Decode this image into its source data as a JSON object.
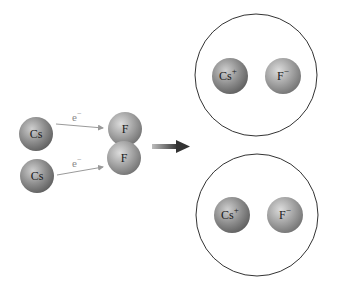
{
  "diagram": {
    "reactants": {
      "cs_top": {
        "label": "Cs"
      },
      "cs_bottom": {
        "label": "Cs"
      },
      "f_top": {
        "label": "F"
      },
      "f_bottom": {
        "label": "F"
      },
      "electron_top": {
        "label": "e",
        "superscript": "−"
      },
      "electron_bottom": {
        "label": "e",
        "superscript": "−"
      }
    },
    "products": {
      "pair_top": {
        "cation": {
          "label": "Cs",
          "superscript": "+"
        },
        "anion": {
          "label": "F",
          "superscript": "−"
        }
      },
      "pair_bottom": {
        "cation": {
          "label": "Cs",
          "superscript": "+"
        },
        "anion": {
          "label": "F",
          "superscript": "−"
        }
      }
    },
    "colors": {
      "cs_fill": "#8c8c8c",
      "f_fill": "#9e9e9e",
      "arrow": "#3a3a3a",
      "electron_arrow": "#9a9a9a",
      "enclosure": "#333333"
    }
  }
}
